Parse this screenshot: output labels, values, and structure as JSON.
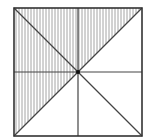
{
  "diagram": {
    "type": "geometry-square-partition",
    "square": {
      "x": 14,
      "y": 8,
      "size": 128
    },
    "center": {
      "x": 78,
      "y": 72
    },
    "colors": {
      "outline": "#333333",
      "inner_lines": "#444444",
      "hatch": "#9a9a9a",
      "background": "#ffffff",
      "center_dot": "#111111"
    },
    "hatch": {
      "direction": "vertical",
      "spacing": 3
    },
    "shaded_triangles": 4,
    "total_triangles": 8
  }
}
